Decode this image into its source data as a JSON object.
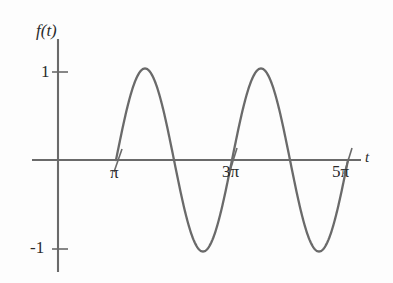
{
  "figure": {
    "background_color": "#fdfdfd",
    "ink_color": "#6a6a6a",
    "text_color": "#2b2b2b"
  },
  "axes": {
    "y_axis_label": "f(t)",
    "x_axis_label": "t",
    "y_ticks": [
      {
        "label": "1",
        "value": 1
      },
      {
        "label": "-1",
        "value": -1
      }
    ],
    "x_ticks": [
      {
        "label": "π",
        "value": 3.14159
      },
      {
        "label": "3π",
        "value": 9.42478
      },
      {
        "label": "5π",
        "value": 15.70796
      }
    ]
  },
  "chart_data": {
    "type": "line",
    "title": "",
    "xlabel": "t",
    "ylabel": "f(t)",
    "xlim": [
      0,
      16.964
    ],
    "ylim": [
      -1.35,
      1.35
    ],
    "grid": false,
    "legend": null,
    "series": [
      {
        "name": "f(t)",
        "expression": "sin(t - pi) for t >= pi, 0 for 0 <= t < pi",
        "domain": [
          0,
          15.70796
        ],
        "amplitude": 1,
        "period": 6.28318,
        "x": [
          0,
          1.5708,
          3.14159,
          3.92699,
          4.71239,
          5.49779,
          6.28319,
          7.06858,
          7.85398,
          8.63938,
          9.42478,
          10.21018,
          10.99557,
          11.78097,
          12.56637,
          13.35177,
          14.13717,
          14.92257,
          15.70796
        ],
        "values": [
          0,
          0,
          0,
          0.70711,
          1,
          0.70711,
          0,
          -0.70711,
          -1,
          -0.70711,
          0,
          0.70711,
          1,
          0.70711,
          0,
          -0.70711,
          -1,
          -0.70711,
          0
        ]
      }
    ],
    "annotations": {
      "flat_segment": "f(t) = 0 on 0 <= t < pi",
      "peaks": [
        {
          "t": 4.71239,
          "value": 1
        },
        {
          "t": 10.99557,
          "value": 1
        }
      ],
      "troughs": [
        {
          "t": 7.85398,
          "value": -1
        },
        {
          "t": 14.13717,
          "value": -1
        }
      ],
      "zero_crossings": [
        3.14159,
        6.28319,
        9.42478,
        12.56637,
        15.70796
      ]
    }
  }
}
